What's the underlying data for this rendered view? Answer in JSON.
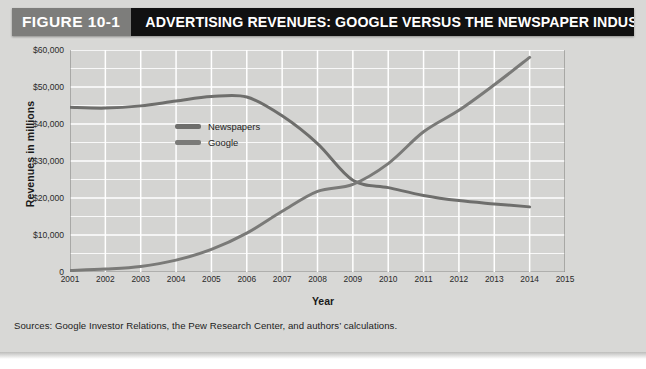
{
  "figure": {
    "number_label": "FIGURE 10-1",
    "title": "ADVERTISING REVENUES: GOOGLE VERSUS THE NEWSPAPER INDUSTRY, 2001–2014",
    "source_note": "Sources: Google Investor Relations, the Pew Research Center, and authors’ calculations."
  },
  "colors": {
    "card_background": "#d8d8d6",
    "plot_background": "#d4d4d2",
    "gridline": "#ffffff",
    "axis": "#8a8a88",
    "figure_number_background": "#7d7d7b",
    "title_background": "#111111",
    "newspapers_line": "#6e6e6c",
    "google_line": "#7a7a78"
  },
  "chart_data": {
    "type": "line",
    "title": "ADVERTISING REVENUES: GOOGLE VERSUS THE NEWSPAPER INDUSTRY, 2001–2014",
    "xlabel": "Year",
    "ylabel": "Revenues in millions",
    "x": [
      2001,
      2002,
      2003,
      2004,
      2005,
      2006,
      2007,
      2008,
      2009,
      2010,
      2011,
      2012,
      2013,
      2014
    ],
    "xlim": [
      2001,
      2015
    ],
    "ylim": [
      0,
      60000
    ],
    "xticks": [
      2001,
      2002,
      2003,
      2004,
      2005,
      2006,
      2007,
      2008,
      2009,
      2010,
      2011,
      2012,
      2013,
      2014,
      2015
    ],
    "xtick_labels": [
      "2001",
      "2002",
      "2003",
      "2004",
      "2005",
      "2006",
      "2007",
      "2008",
      "2009",
      "2010",
      "2011",
      "2012",
      "2013",
      "2014",
      "2015"
    ],
    "yticks": [
      0,
      10000,
      20000,
      30000,
      40000,
      50000,
      60000
    ],
    "ytick_labels": [
      "0",
      "$10,000",
      "$20,000",
      "$30,000",
      "$40,000",
      "$50,000",
      "$60,000"
    ],
    "y_minor_step": 5000,
    "grid": true,
    "legend_position": "upper-left-inside",
    "series": [
      {
        "name": "Newspapers",
        "color": "#6e6e6c",
        "values": [
          44500,
          44300,
          44900,
          46200,
          47400,
          47300,
          42200,
          34700,
          24800,
          22800,
          20700,
          19300,
          18400,
          17600
        ]
      },
      {
        "name": "Google",
        "color": "#7a7a78",
        "values": [
          400,
          800,
          1500,
          3200,
          6100,
          10500,
          16400,
          21800,
          23700,
          29300,
          37900,
          43700,
          50600,
          58000
        ]
      }
    ]
  }
}
